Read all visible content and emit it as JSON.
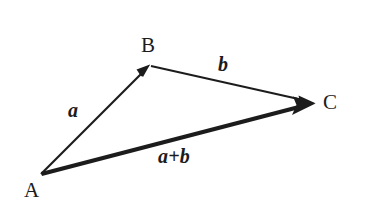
{
  "figure": {
    "type": "vector-addition-triangle",
    "background_color": "#ffffff",
    "stroke_color": "#1c1c1c",
    "width": 365,
    "height": 213
  },
  "points": [
    {
      "id": "A",
      "label": "A",
      "x": 41,
      "y": 174
    },
    {
      "id": "B",
      "label": "B",
      "x": 150,
      "y": 65
    },
    {
      "id": "C",
      "label": "C",
      "x": 315,
      "y": 103
    }
  ],
  "vectors": [
    {
      "id": "a",
      "label": "a",
      "from": "A",
      "to": "B",
      "stroke_width": 2.2,
      "style": "thin",
      "arrowhead": "at-tip"
    },
    {
      "id": "b",
      "label": "b",
      "from": "B",
      "to": "C",
      "stroke_width": 2.2,
      "style": "thin",
      "arrowhead": "at-tip"
    },
    {
      "id": "a+b",
      "label": "a+b",
      "from": "A",
      "to": "C",
      "stroke_width": 4.2,
      "style": "thick",
      "arrowhead": "at-tip"
    }
  ],
  "labels": {
    "point_a": "A",
    "point_b": "B",
    "point_c": "C",
    "vector_a": "a",
    "vector_b": "b",
    "vector_sum": "a+b"
  }
}
